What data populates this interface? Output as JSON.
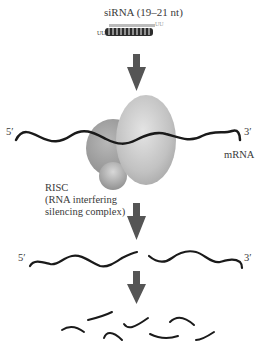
{
  "diagram": {
    "title": "siRNA (19–21 nt)",
    "sirna_overhang_left": "UU",
    "sirna_overhang_right": "UU",
    "mrna_label": "mRNA",
    "five_prime": "5′",
    "three_prime": "3′",
    "risc_label": "RISC",
    "risc_desc_line1": "(RNA interfering",
    "risc_desc_line2": "silencing complex)",
    "steps": [
      "siRNA duplex",
      "RISC binds mRNA",
      "mRNA cleaved",
      "mRNA degraded into fragments"
    ],
    "colors": {
      "arrow": "#555555",
      "strand": "#1a1a1a",
      "risc_light": "#cfcfcf",
      "risc_dark": "#8f8f8f"
    }
  }
}
